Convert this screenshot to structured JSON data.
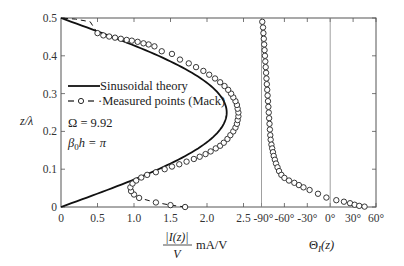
{
  "chart_data": {
    "type": "line",
    "title": "",
    "ylabel": "z/λ",
    "ylim": [
      0,
      0.5
    ],
    "yticks": [
      "0",
      "0.1",
      "0.2",
      "0.3",
      "0.4",
      "0.5"
    ],
    "panels": [
      {
        "name": "magnitude",
        "xlabel_numerator": "|I(z)|",
        "xlabel_denominator": "V",
        "xlabel_unit": "mA/V",
        "xlim": [
          0,
          2.5
        ],
        "xticks": [
          "0",
          "0.5",
          "1.0",
          "1.5",
          "2.0",
          "2.5"
        ],
        "series": [
          {
            "name": "Sinusoidal theory",
            "style": "solid",
            "function": "2.27*sin(2*pi*z)",
            "points": [
              [
                0,
                0
              ],
              [
                0.35,
                0.025
              ],
              [
                0.7,
                0.05
              ],
              [
                1.03,
                0.075
              ],
              [
                1.35,
                0.1
              ],
              [
                1.63,
                0.125
              ],
              [
                1.85,
                0.15
              ],
              [
                2.02,
                0.175
              ],
              [
                2.16,
                0.2
              ],
              [
                2.24,
                0.225
              ],
              [
                2.27,
                0.25
              ],
              [
                2.24,
                0.275
              ],
              [
                2.16,
                0.3
              ],
              [
                2.02,
                0.325
              ],
              [
                1.85,
                0.35
              ],
              [
                1.63,
                0.375
              ],
              [
                1.35,
                0.4
              ],
              [
                1.03,
                0.425
              ],
              [
                0.7,
                0.45
              ],
              [
                0.35,
                0.475
              ],
              [
                0,
                0.5
              ]
            ]
          },
          {
            "name": "Measured points (Mack)",
            "style": "dashed-circles",
            "points": [
              [
                1.7,
                0.0
              ],
              [
                1.5,
                0.005
              ],
              [
                1.3,
                0.012
              ],
              [
                1.07,
                0.024
              ],
              [
                1.0,
                0.033
              ],
              [
                0.96,
                0.042
              ],
              [
                0.95,
                0.052
              ],
              [
                0.98,
                0.062
              ],
              [
                1.03,
                0.07
              ],
              [
                1.1,
                0.078
              ],
              [
                1.18,
                0.085
              ],
              [
                1.3,
                0.092
              ],
              [
                1.42,
                0.1
              ],
              [
                1.52,
                0.107
              ],
              [
                1.62,
                0.113
              ],
              [
                1.72,
                0.12
              ],
              [
                1.82,
                0.127
              ],
              [
                1.9,
                0.133
              ],
              [
                1.98,
                0.14
              ],
              [
                2.05,
                0.147
              ],
              [
                2.12,
                0.155
              ],
              [
                2.18,
                0.162
              ],
              [
                2.23,
                0.17
              ],
              [
                2.28,
                0.18
              ],
              [
                2.32,
                0.19
              ],
              [
                2.36,
                0.2
              ],
              [
                2.39,
                0.21
              ],
              [
                2.41,
                0.22
              ],
              [
                2.42,
                0.23
              ],
              [
                2.43,
                0.24
              ],
              [
                2.43,
                0.25
              ],
              [
                2.42,
                0.26
              ],
              [
                2.41,
                0.27
              ],
              [
                2.39,
                0.28
              ],
              [
                2.36,
                0.29
              ],
              [
                2.33,
                0.3
              ],
              [
                2.29,
                0.31
              ],
              [
                2.24,
                0.32
              ],
              [
                2.18,
                0.33
              ],
              [
                2.11,
                0.34
              ],
              [
                2.03,
                0.35
              ],
              [
                1.95,
                0.36
              ],
              [
                1.85,
                0.37
              ],
              [
                1.75,
                0.38
              ],
              [
                1.63,
                0.39
              ],
              [
                1.52,
                0.405
              ],
              [
                1.38,
                0.412
              ],
              [
                1.28,
                0.425
              ],
              [
                1.2,
                0.43
              ],
              [
                1.13,
                0.433
              ],
              [
                1.05,
                0.437
              ],
              [
                0.97,
                0.44
              ],
              [
                0.9,
                0.442
              ],
              [
                0.82,
                0.445
              ],
              [
                0.74,
                0.448
              ],
              [
                0.66,
                0.451
              ],
              [
                0.58,
                0.454
              ],
              [
                0.5,
                0.46
              ],
              [
                0.4,
                0.49
              ],
              [
                0.2,
                0.497
              ],
              [
                0.0,
                0.5
              ]
            ]
          }
        ]
      },
      {
        "name": "phase",
        "xlabel": "Θ_I(z)",
        "xlim": [
          -90,
          60
        ],
        "xticks": [
          "-90°",
          "-60°",
          "-30°",
          "0°",
          "30°",
          "60°"
        ],
        "series": [
          {
            "name": "Measured phase",
            "style": "circles",
            "points": [
              [
                -89,
                0.49
              ],
              [
                -88,
                0.475
              ],
              [
                -87.5,
                0.46
              ],
              [
                -87,
                0.445
              ],
              [
                -86.5,
                0.43
              ],
              [
                -86,
                0.415
              ],
              [
                -85.5,
                0.4
              ],
              [
                -85,
                0.385
              ],
              [
                -84.5,
                0.37
              ],
              [
                -84,
                0.355
              ],
              [
                -83.5,
                0.34
              ],
              [
                -83,
                0.325
              ],
              [
                -82.5,
                0.31
              ],
              [
                -82,
                0.295
              ],
              [
                -81.5,
                0.28
              ],
              [
                -81,
                0.265
              ],
              [
                -80.5,
                0.25
              ],
              [
                -80,
                0.235
              ],
              [
                -79.5,
                0.22
              ],
              [
                -79,
                0.205
              ],
              [
                -78.5,
                0.19
              ],
              [
                -78,
                0.178
              ],
              [
                -77,
                0.165
              ],
              [
                -76,
                0.155
              ],
              [
                -75,
                0.145
              ],
              [
                -74,
                0.135
              ],
              [
                -72.5,
                0.125
              ],
              [
                -71,
                0.115
              ],
              [
                -69,
                0.105
              ],
              [
                -67,
                0.095
              ],
              [
                -64,
                0.085
              ],
              [
                -60,
                0.077
              ],
              [
                -54,
                0.07
              ],
              [
                -47,
                0.064
              ],
              [
                -41,
                0.058
              ],
              [
                -35,
                0.052
              ],
              [
                -27,
                0.045
              ],
              [
                -16,
                0.035
              ],
              [
                -5,
                0.025
              ],
              [
                8,
                0.018
              ],
              [
                18,
                0.014
              ],
              [
                26,
                0.01
              ],
              [
                32,
                0.006
              ],
              [
                38,
                0.003
              ],
              [
                45,
                0.001
              ]
            ]
          }
        ]
      }
    ],
    "legend": [
      {
        "label": "Sinusoidal theory",
        "style": "solid"
      },
      {
        "label": "Measured points (Mack)",
        "style": "dashed-circle"
      }
    ],
    "annotations": [
      "Ω = 9.92",
      "β0h = π"
    ],
    "grid": false,
    "reference_lines": [
      "Θ = -90°",
      "Θ = 0°"
    ]
  },
  "labels": {
    "y_axis": "z/λ",
    "mag_numerator": "|I(z)|",
    "mag_denominator": "V",
    "mag_unit": "mA/V",
    "phase_label_theta": "Θ",
    "phase_label_sub": "I",
    "phase_label_arg": "(z)",
    "legend_theory": "Sinusoidal theory",
    "legend_measured": "·Measured points (Mack)",
    "omega": "Ω  = 9.92",
    "beta_beta": "β",
    "beta_sub": "0",
    "beta_rest": "h = π"
  }
}
